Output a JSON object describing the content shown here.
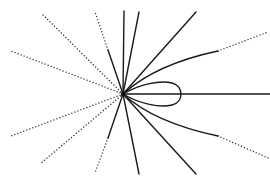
{
  "diagram": {
    "background": "#ffffff",
    "stroke_color": "#1a1a1a",
    "center": [
      123,
      94
    ],
    "solid_rays": [
      {
        "name": "ray-up-vertical",
        "to": [
          124,
          11
        ]
      },
      {
        "name": "ray-up-right-steep",
        "to": [
          139,
          12
        ]
      },
      {
        "name": "ray-up-right",
        "to": [
          196,
          12
        ]
      },
      {
        "name": "ray-down-right-steep",
        "to": [
          139,
          174
        ]
      },
      {
        "name": "ray-down-right",
        "to": [
          196,
          174
        ]
      },
      {
        "name": "ray-horizontal-right",
        "to": [
          270,
          94
        ]
      }
    ],
    "mixed_rays": [
      {
        "name": "ray-up-left-steep",
        "solid_to": [
          108,
          50
        ],
        "dotted_to": [
          95,
          12
        ]
      },
      {
        "name": "ray-down-left-steep",
        "solid_to": [
          108,
          138
        ],
        "dotted_to": [
          95,
          173
        ]
      }
    ],
    "dotted_rays": [
      {
        "name": "ray-up-left",
        "to": [
          41,
          13
        ]
      },
      {
        "name": "ray-left-upper",
        "to": [
          11,
          51
        ]
      },
      {
        "name": "ray-left-lower",
        "to": [
          11,
          136
        ]
      },
      {
        "name": "ray-down-left",
        "to": [
          40,
          164
        ]
      }
    ],
    "curved_separatrices": [
      {
        "name": "curve-upper-right",
        "solid_end": [
          218,
          51
        ],
        "dotted_end": [
          268,
          32
        ]
      },
      {
        "name": "curve-lower-right",
        "solid_end": [
          218,
          136
        ],
        "dotted_end": [
          268,
          158
        ]
      }
    ],
    "loop": {
      "name": "homoclinic-loop",
      "tip": [
        181,
        94
      ],
      "top_y": 83,
      "bottom_y": 105
    }
  }
}
